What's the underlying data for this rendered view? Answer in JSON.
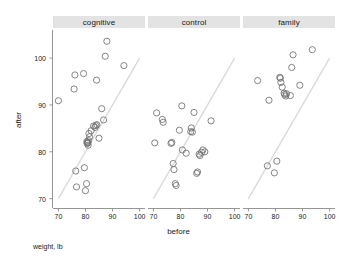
{
  "chart_data": {
    "type": "scatter",
    "title": "",
    "subtitle": "",
    "caption": "weight, lb",
    "xlabel": "before",
    "ylabel": "after",
    "xlim": [
      68,
      102
    ],
    "ylim": [
      68,
      106
    ],
    "xticks": [
      70,
      80,
      90,
      100
    ],
    "yticks": [
      70,
      80,
      90,
      100
    ],
    "grid": false,
    "legend": "none",
    "layout": "trellis-1x3-shared-y",
    "reference_line": {
      "type": "identity",
      "label": "y = x",
      "color": "#d9d9d9",
      "from": [
        70,
        70
      ],
      "to": [
        100,
        100
      ]
    },
    "marker": {
      "shape": "open-circle",
      "color": "#6f6f6f",
      "size_px": 3.1
    },
    "panels": [
      {
        "label": "cognitive",
        "n": 29,
        "points": [
          [
            70.0,
            90.9
          ],
          [
            75.8,
            93.4
          ],
          [
            76.1,
            96.4
          ],
          [
            76.4,
            75.9
          ],
          [
            76.7,
            72.5
          ],
          [
            79.3,
            96.7
          ],
          [
            79.6,
            76.6
          ],
          [
            80.0,
            71.7
          ],
          [
            80.4,
            73.2
          ],
          [
            80.5,
            82.2
          ],
          [
            80.6,
            81.8
          ],
          [
            80.8,
            82.0
          ],
          [
            80.9,
            81.9
          ],
          [
            81.0,
            81.4
          ],
          [
            81.1,
            82.4
          ],
          [
            81.3,
            83.9
          ],
          [
            81.5,
            83.2
          ],
          [
            82.1,
            84.5
          ],
          [
            83.0,
            85.5
          ],
          [
            83.8,
            85.6
          ],
          [
            84.1,
            95.3
          ],
          [
            84.2,
            85.8
          ],
          [
            85.0,
            82.9
          ],
          [
            86.0,
            89.2
          ],
          [
            86.7,
            86.8
          ],
          [
            87.3,
            100.4
          ],
          [
            87.9,
            103.6
          ],
          [
            94.2,
            98.4
          ],
          [
            83.5,
            85.2
          ]
        ]
      },
      {
        "label": "control",
        "n": 26,
        "points": [
          [
            70.5,
            81.9
          ],
          [
            71.2,
            88.3
          ],
          [
            73.3,
            86.9
          ],
          [
            73.6,
            86.3
          ],
          [
            76.5,
            81.8
          ],
          [
            76.8,
            82.0
          ],
          [
            77.3,
            77.5
          ],
          [
            77.6,
            76.2
          ],
          [
            78.1,
            73.2
          ],
          [
            78.4,
            72.8
          ],
          [
            79.6,
            84.6
          ],
          [
            80.5,
            89.8
          ],
          [
            80.7,
            80.4
          ],
          [
            82.1,
            79.7
          ],
          [
            83.8,
            84.3
          ],
          [
            84.0,
            85.1
          ],
          [
            84.4,
            84.2
          ],
          [
            85.0,
            88.4
          ],
          [
            86.0,
            75.4
          ],
          [
            86.3,
            75.7
          ],
          [
            87.2,
            79.2
          ],
          [
            87.8,
            79.9
          ],
          [
            88.3,
            80.4
          ],
          [
            89.0,
            80.0
          ],
          [
            91.3,
            86.6
          ],
          [
            86.9,
            79.5
          ]
        ]
      },
      {
        "label": "family",
        "n": 17,
        "points": [
          [
            73.4,
            95.2
          ],
          [
            77.0,
            77.0
          ],
          [
            77.6,
            91.0
          ],
          [
            79.6,
            75.5
          ],
          [
            80.5,
            78.0
          ],
          [
            81.6,
            95.9
          ],
          [
            81.8,
            95.7
          ],
          [
            82.0,
            94.8
          ],
          [
            82.5,
            93.8
          ],
          [
            83.2,
            92.5
          ],
          [
            83.4,
            92.2
          ],
          [
            83.8,
            91.9
          ],
          [
            84.1,
            92.4
          ],
          [
            85.5,
            92.0
          ],
          [
            86.0,
            98.0
          ],
          [
            86.5,
            100.7
          ],
          [
            89.0,
            94.2
          ],
          [
            93.6,
            101.8
          ]
        ]
      }
    ]
  },
  "axes": {
    "x_tick_labels": [
      "70",
      "80",
      "90",
      "100"
    ],
    "y_tick_labels": [
      "70",
      "80",
      "90",
      "100"
    ],
    "x_title": "before",
    "y_title": "after"
  },
  "strips": {
    "items": [
      {
        "label": "cognitive"
      },
      {
        "label": "control"
      },
      {
        "label": "family"
      }
    ]
  },
  "footer": {
    "caption": "weight, lb"
  },
  "colors": {
    "strip_bg": "#e3e3e3",
    "axis": "#8a8a8a",
    "marker": "#6f6f6f",
    "reference_line": "#d9d9d9",
    "text": "#1a1a1a",
    "background": "#ffffff"
  }
}
